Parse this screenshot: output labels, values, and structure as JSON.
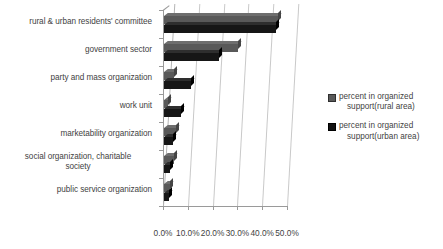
{
  "chart_data": {
    "type": "bar",
    "orientation": "horizontal",
    "title": "",
    "xlabel": "",
    "ylabel": "",
    "xlim": [
      0,
      50
    ],
    "xtick_labels": [
      "0.0%",
      "10.0%",
      "20.0%",
      "30.0%",
      "40.0%",
      "50.0%"
    ],
    "xtick_values": [
      0,
      10,
      20,
      30,
      40,
      50
    ],
    "grid": true,
    "legend_position": "right",
    "style": "3d-bar",
    "categories": [
      "rural & urban residents' committee",
      "government sector",
      "party and mass organization",
      "work unit",
      "marketability organization",
      "social organization, charitable society",
      "public service organization"
    ],
    "series": [
      {
        "name": "percent in organized support(rural area)",
        "color": "#595959",
        "values": [
          46.0,
          30.0,
          4.0,
          1.5,
          5.0,
          4.0,
          2.5
        ]
      },
      {
        "name": "percent in organized support(urban area)",
        "color": "#111111",
        "values": [
          45.0,
          22.0,
          11.0,
          7.0,
          3.5,
          2.5,
          2.0
        ]
      }
    ]
  },
  "legend": {
    "items": [
      {
        "label": "percent in organized support(rural area)",
        "line1": "percent in organized",
        "line2": "support(rural area)"
      },
      {
        "label": "percent in organized support(urban area)",
        "line1": "percent in organized",
        "line2": "support(urban area)"
      }
    ]
  },
  "categories_display": [
    {
      "line1": "rural & urban residents' committee",
      "line2": ""
    },
    {
      "line1": "government sector",
      "line2": ""
    },
    {
      "line1": "party and mass organization",
      "line2": ""
    },
    {
      "line1": "work unit",
      "line2": ""
    },
    {
      "line1": "marketability organization",
      "line2": ""
    },
    {
      "line1": "social organization,  charitable",
      "line2": "society"
    },
    {
      "line1": "public service organization",
      "line2": ""
    }
  ]
}
